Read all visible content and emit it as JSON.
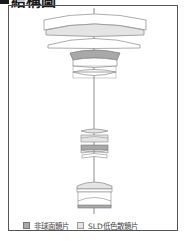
{
  "title": "結構圖",
  "legend": {
    "items": [
      {
        "label": "非球面鏡片",
        "swatch_color": "#a8a8a8"
      },
      {
        "label": "SLD低色散鏡片",
        "swatch_color": "#e4e4e4"
      }
    ]
  },
  "colors": {
    "frame": "#555555",
    "lens_outline": "#888888",
    "aspherical_fill": "#a8a8a8",
    "sld_fill": "#e4e4e4",
    "axis": "#444444"
  }
}
